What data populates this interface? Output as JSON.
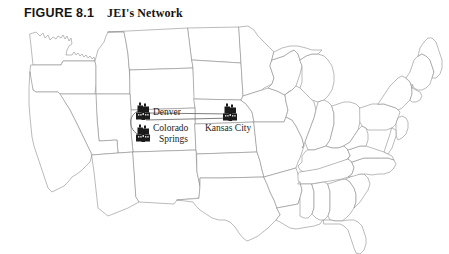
{
  "figure": {
    "number": "FIGURE 8.1",
    "title": "JEI's Network"
  },
  "map": {
    "region_name": "United States",
    "background_color": "#ffffff",
    "border_color": "#8d8d8d"
  },
  "network": {
    "link_color": "#6f6f6f",
    "node_color": "#1a1a1a",
    "nodes": [
      {
        "id": "denver",
        "label": "Denver",
        "icon": "factory-icon",
        "x": 143,
        "y": 112
      },
      {
        "id": "colorado-springs",
        "label_line1": "Colorado",
        "label_line2": "Springs",
        "icon": "factory-icon",
        "x": 143,
        "y": 134
      },
      {
        "id": "kansas-city",
        "label": "Kansas City",
        "icon": "factory-icon",
        "x": 230,
        "y": 113
      }
    ],
    "links": [
      {
        "from": "denver",
        "to": "kansas-city"
      },
      {
        "from": "colorado-springs",
        "to": "kansas-city"
      },
      {
        "from": "denver",
        "to": "colorado-springs"
      }
    ]
  }
}
